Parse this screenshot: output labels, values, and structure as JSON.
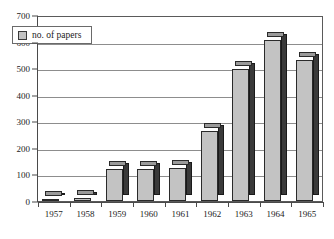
{
  "chart_data": {
    "type": "bar",
    "title": "",
    "xlabel": "",
    "ylabel": "",
    "categories": [
      "1957",
      "1958",
      "1959",
      "1960",
      "1961",
      "1962",
      "1963",
      "1964",
      "1965"
    ],
    "values": [
      2,
      12,
      120,
      120,
      125,
      265,
      495,
      605,
      530
    ],
    "series": [
      {
        "name": "no. of papers",
        "values": [
          2,
          12,
          120,
          120,
          125,
          265,
          495,
          605,
          530
        ]
      }
    ],
    "ylim": [
      0,
      700
    ],
    "ytick_values": [
      0,
      100,
      200,
      300,
      400,
      500,
      600,
      700
    ],
    "ytick_labels": [
      "0",
      "100",
      "200",
      "300",
      "400",
      "500",
      "600",
      "700"
    ],
    "grid": true,
    "legend": {
      "position": "top-left-inside",
      "entries": [
        {
          "label": "no. of papers",
          "swatch": "legend-swatch",
          "color": "#c3c3c3"
        }
      ]
    },
    "style": {
      "bar_face_color": "#c3c3c3",
      "bar_side_color": "#3a3a3a",
      "bar_top_color": "#9a9a9a",
      "bar_outline_color": "#2a2a2a",
      "gridline_color": "#8d8d8d",
      "axis_color": "#4a4a4a",
      "plot_background": "#ffffff",
      "three_d": true
    }
  }
}
